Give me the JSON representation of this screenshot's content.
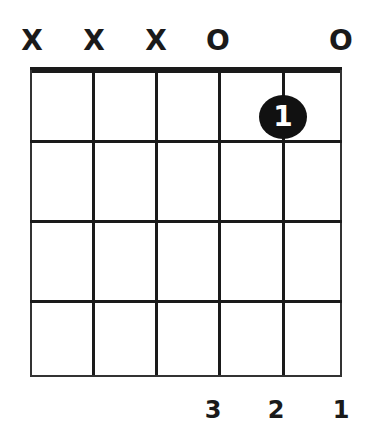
{
  "diagram": {
    "type": "guitar-chord",
    "strings": 6,
    "frets_shown": 4,
    "string_markers": [
      "X",
      "X",
      "X",
      "O",
      "",
      "O"
    ],
    "fingers": [
      {
        "string": 5,
        "fret": 1,
        "label": "1"
      }
    ],
    "bottom_finger_numbers": [
      "",
      "",
      "",
      "3",
      "2",
      "1"
    ],
    "colors": {
      "ink": "#1a1a1a",
      "background": "#ffffff",
      "finger_dot": "#111111",
      "finger_text": "#ffffff"
    }
  }
}
